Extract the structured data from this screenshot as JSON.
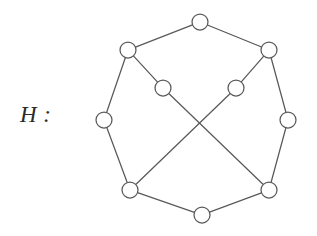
{
  "figure": {
    "label": "H :",
    "label_name": "graph-name-label",
    "background_color": "#ffffff",
    "stroke_color": "#595959",
    "node_fill_color": "#ffffff",
    "node_radius": 8,
    "edge_width": 1.25,
    "width": 317,
    "height": 236
  },
  "graph": {
    "type": "undirected-graph",
    "vertex_count": 10,
    "edge_count": 12,
    "nodes": [
      {
        "id": "top",
        "label": "",
        "x": 200,
        "y": 22,
        "role": "outer"
      },
      {
        "id": "upper-right",
        "label": "",
        "x": 269,
        "y": 50,
        "role": "outer"
      },
      {
        "id": "right",
        "label": "",
        "x": 288,
        "y": 120,
        "role": "outer"
      },
      {
        "id": "bottom-right",
        "label": "",
        "x": 269,
        "y": 190,
        "role": "outer"
      },
      {
        "id": "bottom",
        "label": "",
        "x": 202,
        "y": 215,
        "role": "outer"
      },
      {
        "id": "bottom-left",
        "label": "",
        "x": 130,
        "y": 190,
        "role": "outer"
      },
      {
        "id": "left",
        "label": "",
        "x": 104,
        "y": 120,
        "role": "outer"
      },
      {
        "id": "upper-left",
        "label": "",
        "x": 128,
        "y": 50,
        "role": "outer"
      },
      {
        "id": "inner-left",
        "label": "",
        "x": 163,
        "y": 88,
        "role": "inner"
      },
      {
        "id": "inner-right",
        "label": "",
        "x": 236,
        "y": 88,
        "role": "inner"
      }
    ],
    "edges": [
      {
        "from": "top",
        "to": "upper-left",
        "kind": "outer-cycle"
      },
      {
        "from": "top",
        "to": "upper-right",
        "kind": "outer-cycle"
      },
      {
        "from": "upper-right",
        "to": "right",
        "kind": "outer-cycle"
      },
      {
        "from": "right",
        "to": "bottom-right",
        "kind": "outer-cycle"
      },
      {
        "from": "bottom-right",
        "to": "bottom",
        "kind": "outer-cycle"
      },
      {
        "from": "bottom",
        "to": "bottom-left",
        "kind": "outer-cycle"
      },
      {
        "from": "bottom-left",
        "to": "left",
        "kind": "outer-cycle"
      },
      {
        "from": "left",
        "to": "upper-left",
        "kind": "outer-cycle"
      },
      {
        "from": "upper-left",
        "to": "inner-left",
        "kind": "spoke"
      },
      {
        "from": "upper-right",
        "to": "inner-right",
        "kind": "spoke"
      },
      {
        "from": "inner-left",
        "to": "bottom-right",
        "kind": "crossing-diagonal"
      },
      {
        "from": "inner-right",
        "to": "bottom-left",
        "kind": "crossing-diagonal"
      }
    ]
  }
}
